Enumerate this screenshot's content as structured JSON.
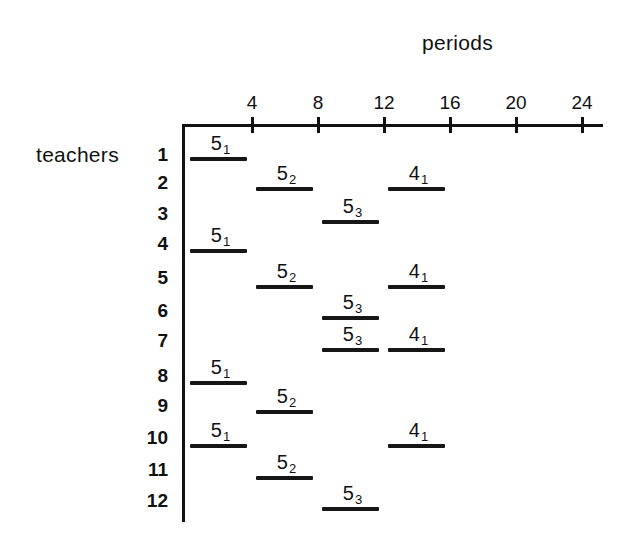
{
  "chart_data": {
    "type": "gantt",
    "title": "",
    "xlabel": "periods",
    "ylabel": "teachers",
    "x_ticks": [
      4,
      8,
      12,
      16,
      20,
      24
    ],
    "x_range": [
      0,
      25
    ],
    "rows": [
      "1",
      "2",
      "3",
      "4",
      "5",
      "6",
      "7",
      "8",
      "9",
      "10",
      "11",
      "12"
    ],
    "tasks": [
      {
        "teacher": 1,
        "label": "5",
        "sub": "1",
        "start": 0,
        "end": 4
      },
      {
        "teacher": 2,
        "label": "5",
        "sub": "2",
        "start": 4,
        "end": 8
      },
      {
        "teacher": 2,
        "label": "4",
        "sub": "1",
        "start": 12,
        "end": 16
      },
      {
        "teacher": 3,
        "label": "5",
        "sub": "3",
        "start": 8,
        "end": 12
      },
      {
        "teacher": 4,
        "label": "5",
        "sub": "1",
        "start": 0,
        "end": 4
      },
      {
        "teacher": 5,
        "label": "5",
        "sub": "2",
        "start": 4,
        "end": 8
      },
      {
        "teacher": 5,
        "label": "4",
        "sub": "1",
        "start": 12,
        "end": 16
      },
      {
        "teacher": 6,
        "label": "5",
        "sub": "3",
        "start": 8,
        "end": 12
      },
      {
        "teacher": 7,
        "label": "5",
        "sub": "3",
        "start": 8,
        "end": 12
      },
      {
        "teacher": 7,
        "label": "4",
        "sub": "1",
        "start": 12,
        "end": 16
      },
      {
        "teacher": 8,
        "label": "5",
        "sub": "1",
        "start": 0,
        "end": 4
      },
      {
        "teacher": 9,
        "label": "5",
        "sub": "2",
        "start": 4,
        "end": 8
      },
      {
        "teacher": 10,
        "label": "5",
        "sub": "1",
        "start": 0,
        "end": 4
      },
      {
        "teacher": 10,
        "label": "4",
        "sub": "1",
        "start": 12,
        "end": 16
      },
      {
        "teacher": 11,
        "label": "5",
        "sub": "2",
        "start": 4,
        "end": 8
      },
      {
        "teacher": 12,
        "label": "5",
        "sub": "3",
        "start": 8,
        "end": 12
      }
    ],
    "grid": false,
    "legend": null
  },
  "labels": {
    "x_axis_title": "periods",
    "y_axis_title": "teachers"
  },
  "layout": {
    "origin_x": 186,
    "px_per_period": 16.5,
    "axis_y": 125,
    "axis_left": 183,
    "axis_right": 603,
    "axis_bottom": 522,
    "row_label_y": [
      144,
      172,
      203,
      233,
      267,
      300,
      330,
      365,
      395,
      427,
      459,
      490
    ],
    "row_bar_y": [
      159,
      189,
      222,
      251,
      287,
      318,
      350,
      383,
      412,
      446,
      478,
      509
    ]
  },
  "colors": {
    "ink": "#111111",
    "background": "#ffffff"
  }
}
